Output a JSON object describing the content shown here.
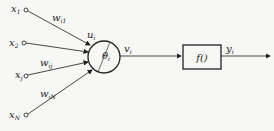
{
  "diagram": {
    "inputs": [
      {
        "label": "x",
        "sub": "1",
        "weight": "w",
        "weight_sub": "i1",
        "node": [
          26,
          10
        ],
        "label_pos": [
          10,
          12
        ],
        "weight_pos": [
          54,
          22
        ]
      },
      {
        "label": "x",
        "sub": "2",
        "weight": "w",
        "weight_sub": "",
        "node": [
          24,
          43
        ],
        "label_pos": [
          9,
          46
        ],
        "weight_pos": [
          0,
          0
        ]
      },
      {
        "label": "x",
        "sub": "j",
        "weight": "w",
        "weight_sub": "ij",
        "node": [
          26,
          76
        ],
        "label_pos": [
          13,
          79
        ],
        "weight_pos": [
          41,
          62
        ]
      },
      {
        "label": "x",
        "sub": "N",
        "weight": "w",
        "weight_sub": "iN",
        "node": [
          26,
          115
        ],
        "label_pos": [
          9,
          118
        ],
        "weight_pos": [
          40,
          96
        ]
      }
    ],
    "neuron": {
      "sum_label": "u",
      "sum_sub": "i",
      "threshold_label": "θ",
      "threshold_sub": "i",
      "center": [
        104,
        57
      ],
      "radius": 16
    },
    "net_output": {
      "label": "v",
      "sub": "i"
    },
    "activation": {
      "label": "f()"
    },
    "output": {
      "label": "y",
      "sub": "i"
    },
    "colors": {
      "stroke": "#222222",
      "background": "#f7f7f5"
    }
  }
}
